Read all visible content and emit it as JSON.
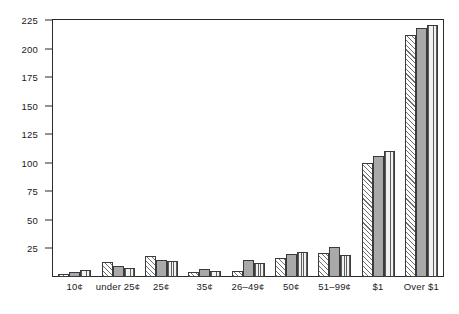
{
  "chart_data": {
    "type": "bar",
    "title": "",
    "subtitle": "",
    "xlabel": "",
    "ylabel": "",
    "grid": false,
    "legend_position": "none",
    "ylim": [
      0,
      225
    ],
    "ytick_step": 25,
    "yticks": [
      0,
      25,
      50,
      75,
      100,
      125,
      150,
      175,
      200,
      225
    ],
    "ytick_labels": [
      "0",
      "25",
      "50",
      "75",
      "100",
      "125",
      "150",
      "175",
      "200",
      "225"
    ],
    "categories": [
      "10¢",
      "under 25¢",
      "25¢",
      "35¢",
      "26–49¢",
      "50¢",
      "51–99¢",
      "$1",
      "Over $1"
    ],
    "series": [
      {
        "name": "series-1",
        "pattern": "diagonal-hatch",
        "values": [
          3,
          13,
          18,
          4,
          5,
          17,
          21,
          100,
          212
        ]
      },
      {
        "name": "series-2",
        "pattern": "solid-gray",
        "values": [
          4,
          10,
          15,
          7,
          15,
          20,
          26,
          106,
          218
        ]
      },
      {
        "name": "series-3",
        "pattern": "vertical-stripes",
        "values": [
          6,
          8,
          14,
          5,
          12,
          22,
          19,
          110,
          221
        ]
      }
    ],
    "colors": {
      "axis": "#2b2b2b",
      "bar_outline": "#3a3a3a",
      "series_1_fill": "#fdfdfd",
      "series_1_hatch": "#6f6f6f",
      "series_2_fill": "#a9a9a9",
      "series_3_fill": "#f2f2f2",
      "series_3_hatch": "#5d5d5d",
      "background": "#ffffff"
    }
  }
}
